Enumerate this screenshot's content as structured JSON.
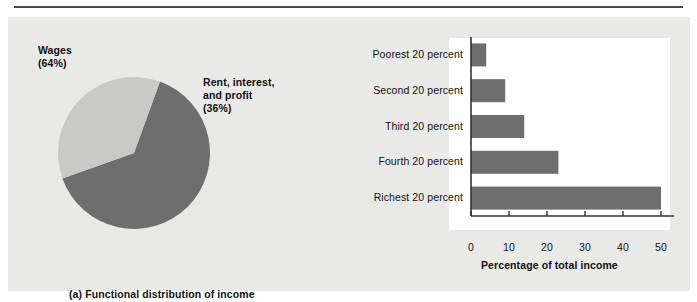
{
  "figure": {
    "background_color": "#ffffff",
    "panel_color": "#e9e9e7",
    "plot_color": "#ffffff",
    "rule_color": "#4a4a4a",
    "dark_gray": "#6e6e6e",
    "light_gray": "#c9c9c7",
    "text_color": "#111111"
  },
  "panel_a": {
    "caption": "(a) Functional distribution of income",
    "labels": {
      "wages_line1": "Wages",
      "wages_line2": "(64%)",
      "rent_line1": "Rent, interest,",
      "rent_line2": "and profit",
      "rent_line3": "(36%)"
    }
  },
  "panel_b": {
    "caption": "(b) Personal distribution of income",
    "x_axis_title": "Percentage of total income"
  },
  "chart_data": [
    {
      "type": "pie",
      "title": "(a) Functional distribution of income",
      "labels": [
        "Wages",
        "Rent, interest, and profit"
      ],
      "values": [
        64,
        36
      ],
      "value_unit": "percent",
      "colors": [
        "#6e6e6e",
        "#c9c9c7"
      ],
      "legend": "inline-labels",
      "annotations": [
        "Wages (64%)",
        "Rent, interest, and profit (36%)"
      ]
    },
    {
      "type": "bar",
      "orientation": "horizontal",
      "title": "(b) Personal distribution of income",
      "categories": [
        "Poorest 20 percent",
        "Second 20 percent",
        "Third 20 percent",
        "Fourth 20 percent",
        "Richest 20 percent"
      ],
      "values": [
        4,
        9,
        14,
        23,
        50
      ],
      "xlabel": "Percentage of total income",
      "ylabel": "",
      "xlim": [
        0,
        50
      ],
      "xticks": [
        0,
        10,
        20,
        30,
        40,
        50
      ],
      "xticklabels": [
        "0",
        "10",
        "20",
        "30",
        "40",
        "50"
      ],
      "grid": false,
      "legend": "none",
      "bar_color": "#6e6e6e"
    }
  ]
}
